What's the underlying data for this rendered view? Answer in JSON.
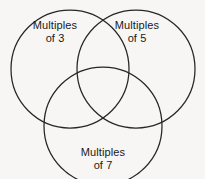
{
  "diagram": {
    "type": "venn-diagram",
    "set_count": 3,
    "background_color": "#f7f6f4",
    "stroke_color": "#262626",
    "sets": [
      {
        "id": "multiples-of-3",
        "label_line_1": "Multiples",
        "label_line_2": "of 3",
        "position": "top-left",
        "cx": 70,
        "cy": 69,
        "r": 59
      },
      {
        "id": "multiples-of-5",
        "label_line_1": "Multiples",
        "label_line_2": "of 5",
        "position": "top-right",
        "cx": 136,
        "cy": 69,
        "r": 59
      },
      {
        "id": "multiples-of-7",
        "label_line_1": "Multiples",
        "label_line_2": "of 7",
        "position": "bottom-center",
        "cx": 103,
        "cy": 126,
        "r": 59
      }
    ]
  }
}
